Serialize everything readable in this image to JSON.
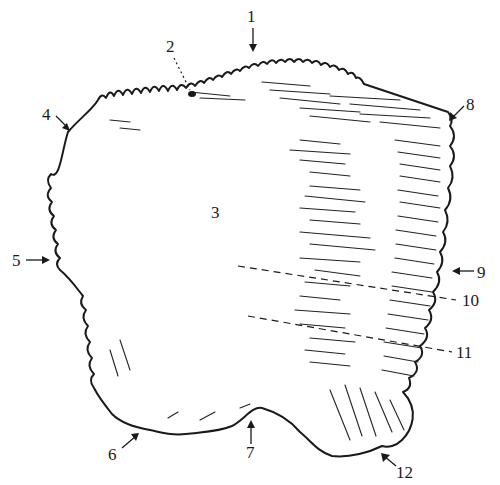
{
  "figure": {
    "colors": {
      "ink": "#1a1a1a",
      "background": "#ffffff"
    },
    "labels": [
      {
        "id": "1",
        "text": "1",
        "x": 252,
        "y": 22
      },
      {
        "id": "2",
        "text": "2",
        "x": 170,
        "y": 50
      },
      {
        "id": "3",
        "text": "3",
        "x": 216,
        "y": 218
      },
      {
        "id": "4",
        "text": "4",
        "x": 46,
        "y": 120
      },
      {
        "id": "5",
        "text": "5",
        "x": 14,
        "y": 264
      },
      {
        "id": "6",
        "text": "6",
        "x": 112,
        "y": 460
      },
      {
        "id": "7",
        "text": "7",
        "x": 250,
        "y": 456
      },
      {
        "id": "8",
        "text": "8",
        "x": 468,
        "y": 108
      },
      {
        "id": "9",
        "text": "9",
        "x": 478,
        "y": 276
      },
      {
        "id": "10",
        "text": "10",
        "x": 462,
        "y": 306
      },
      {
        "id": "11",
        "text": "11",
        "x": 456,
        "y": 358
      },
      {
        "id": "12",
        "text": "12",
        "x": 398,
        "y": 478
      }
    ]
  }
}
